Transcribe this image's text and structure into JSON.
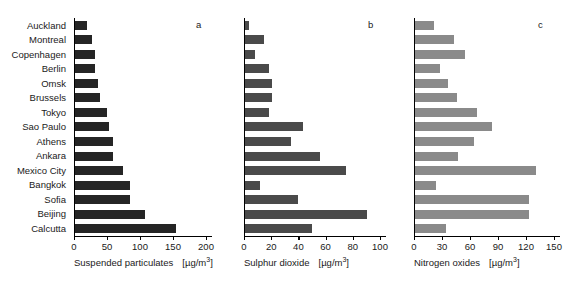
{
  "chart_data": {
    "type": "bar",
    "title": "",
    "orientation": "horizontal",
    "grid": false,
    "legend": "none",
    "categories": [
      "Auckland",
      "Montreal",
      "Copenhagen",
      "Berlin",
      "Omsk",
      "Brussels",
      "Tokyo",
      "Sao Paulo",
      "Athens",
      "Ankara",
      "Mexico City",
      "Bangkok",
      "Sofia",
      "Beijing",
      "Calcutta"
    ],
    "panels": [
      {
        "letter": "a",
        "xlabel": "Suspended particulates",
        "unit": "[µg/m³]",
        "color": "#252525",
        "xlim": [
          0,
          200
        ],
        "ticks": [
          0,
          50,
          100,
          150,
          200
        ],
        "tick_labels": [
          "0",
          "50",
          "100",
          "150",
          "200"
        ],
        "values": [
          18,
          26,
          30,
          30,
          35,
          38,
          49,
          52,
          58,
          57,
          72,
          83,
          84,
          106,
          153
        ]
      },
      {
        "letter": "b",
        "xlabel": "Sulphur dioxide",
        "unit": "[µg/m³]",
        "color": "#4a4a4a",
        "xlim": [
          0,
          100
        ],
        "ticks": [
          0,
          20,
          40,
          60,
          80,
          100
        ],
        "tick_labels": [
          "0",
          "20",
          "40",
          "60",
          "80",
          "100"
        ],
        "values": [
          3,
          14,
          7,
          18,
          20,
          20,
          18,
          43,
          34,
          55,
          74,
          11,
          39,
          90,
          49
        ]
      },
      {
        "letter": "c",
        "xlabel": "Nitrogen oxides",
        "unit": "[µg/m³]",
        "color": "#8a8a8a",
        "xlim": [
          0,
          150
        ],
        "ticks": [
          0,
          30,
          60,
          90,
          120,
          150
        ],
        "tick_labels": [
          "0",
          "30",
          "60",
          "90",
          "120",
          "150"
        ],
        "values": [
          20,
          42,
          54,
          27,
          35,
          45,
          66,
          83,
          63,
          46,
          130,
          23,
          122,
          122,
          33
        ]
      }
    ]
  }
}
